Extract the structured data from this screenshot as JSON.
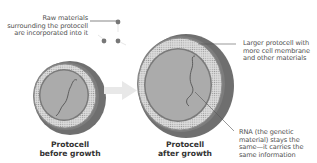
{
  "diagram": {
    "annotations": {
      "raw_materials": [
        "Raw materials",
        "surrounding the protocell",
        "are incorporated into it"
      ],
      "larger_protocell": [
        "Larger protocell with",
        "more cell membrane",
        "and other materials"
      ],
      "rna": [
        "RNA (the genetic",
        "material) stays the",
        "same—it carries the",
        "same information"
      ]
    },
    "captions": {
      "before": [
        "Protocell",
        "before growth"
      ],
      "after": [
        "Protocell",
        "after growth"
      ]
    },
    "colors": {
      "outer_shell": "#6f6f6f",
      "membrane_band": "#d6d6d6",
      "interior": "#a8a8a8",
      "rna_strand": "#5a5a5a",
      "arrow": "#e6e6e6"
    }
  }
}
